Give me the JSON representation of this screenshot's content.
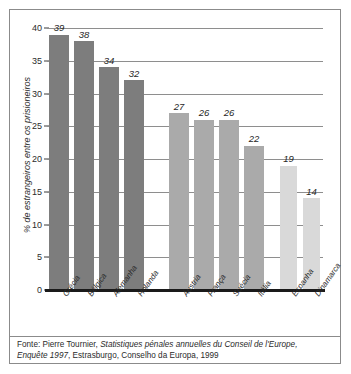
{
  "chart_data": {
    "type": "bar",
    "title": "",
    "subtitle": "",
    "xlabel": "",
    "ylabel": "% de estrangeiros entre os prisioneiros",
    "ylim": [
      0,
      40
    ],
    "ytick_values": [
      0,
      5,
      10,
      15,
      20,
      25,
      30,
      35,
      40
    ],
    "ytick_labels": [
      "0",
      "5",
      "10",
      "15",
      "20",
      "25",
      "30",
      "35",
      "40"
    ],
    "grid": true,
    "grid_axis": "y",
    "legend": false,
    "categories": [
      "Grécia",
      "Bélgica",
      "Alemanha",
      "Holanda",
      "Áustria",
      "França",
      "Suécia",
      "Itália",
      "Espanha",
      "Dinamarca"
    ],
    "values": [
      39,
      38,
      34,
      32,
      27,
      26,
      26,
      22,
      19,
      14
    ],
    "value_labels": [
      "39",
      "38",
      "34",
      "32",
      "27",
      "26",
      "26",
      "22",
      "19",
      "14"
    ],
    "groups": [
      {
        "name": "grupo-escuro",
        "color": "#7d7d7d",
        "categories": [
          "Grécia",
          "Bélgica",
          "Alemanha",
          "Holanda"
        ],
        "values": [
          39,
          38,
          34,
          32
        ]
      },
      {
        "name": "grupo-medio",
        "color": "#aaaaaa",
        "categories": [
          "Áustria",
          "França",
          "Suécia",
          "Itália"
        ],
        "values": [
          27,
          26,
          26,
          22
        ]
      },
      {
        "name": "grupo-claro",
        "color": "#d9d9d9",
        "categories": [
          "Espanha",
          "Dinamarca"
        ],
        "values": [
          19,
          14
        ]
      }
    ],
    "bars": [
      {
        "category": "Grécia",
        "value": 39,
        "label": "39",
        "group": 0,
        "color": "#7d7d7d",
        "x": 2,
        "width": 20
      },
      {
        "category": "Bélgica",
        "value": 38,
        "label": "38",
        "group": 0,
        "color": "#7d7d7d",
        "x": 27,
        "width": 20
      },
      {
        "category": "Alemanha",
        "value": 34,
        "label": "34",
        "group": 0,
        "color": "#7d7d7d",
        "x": 52,
        "width": 20
      },
      {
        "category": "Holanda",
        "value": 32,
        "label": "32",
        "group": 0,
        "color": "#7d7d7d",
        "x": 77,
        "width": 20
      },
      {
        "category": "Áustria",
        "value": 27,
        "label": "27",
        "group": 1,
        "color": "#aaaaaa",
        "x": 122,
        "width": 20
      },
      {
        "category": "França",
        "value": 26,
        "label": "26",
        "group": 1,
        "color": "#aaaaaa",
        "x": 147,
        "width": 20
      },
      {
        "category": "Suécia",
        "value": 26,
        "label": "26",
        "group": 1,
        "color": "#aaaaaa",
        "x": 172,
        "width": 20
      },
      {
        "category": "Itália",
        "value": 22,
        "label": "22",
        "group": 1,
        "color": "#aaaaaa",
        "x": 197,
        "width": 20
      },
      {
        "category": "Espanha",
        "value": 19,
        "label": "19",
        "group": 2,
        "color": "#d9d9d9",
        "x": 233,
        "width": 17
      },
      {
        "category": "Dinamarca",
        "value": 14,
        "label": "14",
        "group": 2,
        "color": "#d9d9d9",
        "x": 256,
        "width": 17
      }
    ],
    "category_label_x": [
      4,
      29,
      54,
      79,
      124,
      149,
      174,
      199,
      234,
      257
    ]
  },
  "footnote": {
    "prefix": "Fonte: Pierre Tournier, ",
    "italic_title": "Statistiques pénales annuelles du Conseil de l'Europe, Enquête 1997",
    "suffix": ", Estrasburgo, Conselho da Europa, 1999"
  }
}
